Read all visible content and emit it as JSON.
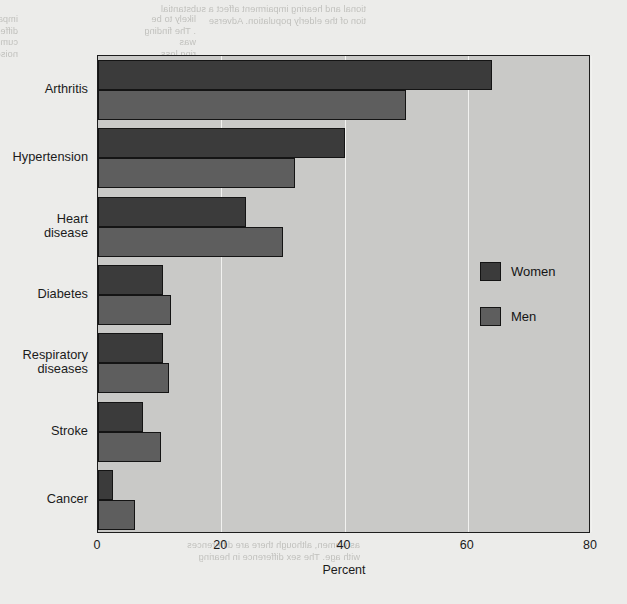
{
  "chart_data": {
    "type": "bar",
    "orientation": "horizontal",
    "title": "",
    "xlabel": "Percent",
    "ylabel": "",
    "xlim": [
      0,
      80
    ],
    "xticks": [
      0,
      20,
      40,
      60,
      80
    ],
    "xtick_labels": [
      "0",
      "20",
      "40",
      "60",
      "80"
    ],
    "grid": true,
    "grid_axis": "x",
    "legend_position": "right-middle",
    "categories": [
      "Arthritis",
      "Hypertension",
      "Heart\ndisease",
      "Diabetes",
      "Respiratory\ndiseases",
      "Stroke",
      "Cancer"
    ],
    "series": [
      {
        "name": "Women",
        "color": "#3b3b3b",
        "values": [
          64,
          40,
          24,
          10.5,
          10.5,
          7.3,
          2.4
        ]
      },
      {
        "name": "Men",
        "color": "#5e5e5e",
        "values": [
          50,
          32,
          30,
          11.8,
          11.5,
          10.3,
          6.0
        ]
      }
    ]
  },
  "legend": {
    "entries": [
      {
        "label": "Women",
        "swatch": "women"
      },
      {
        "label": "Men",
        "swatch": "men"
      }
    ]
  },
  "axis": {
    "x_title": "Percent"
  },
  "background_text": {
    "top_left": "impairment may be attributed in part to differences in\ncumulative occupational exposure to noise (2).",
    "top_mid": "likely to be\n. The finding\nwas\nring loss",
    "right_col_head": "tional and hearing impairment affect a substantial\ntion of the elderly population. Adverse",
    "right_col": "In 1991, 29 percent of noninstitutionalized persons\nthat 70 and over reported some difficulty\nall activity for 20 minutes in the home. In 1991,\nThe prevalence of hearing impairment is linked\nsignificantly among 65 and over, with 26 percent of\na 51 percent of persons 85 and over.",
    "right_col2": "Diabetes, glaucoma, and macular degeneration are\nthe leading causes of visual impairment among the older\npopulation. Between 1991 and 1992, cataract surgery\nwas the most common surgical procedure performed\namong Medicare patients.",
    "right_col3": "Hearing loss is often more difficult to detect in\nolder men, though may be hidden from view of visual\nor hearing impairment. The prevalence of visual\nimpairment was 18 percent 70 years of age and over\nand is far more prevalent among black women.",
    "bottom": "as women, although there are differences\nwith age. The sex difference in hearing"
  }
}
